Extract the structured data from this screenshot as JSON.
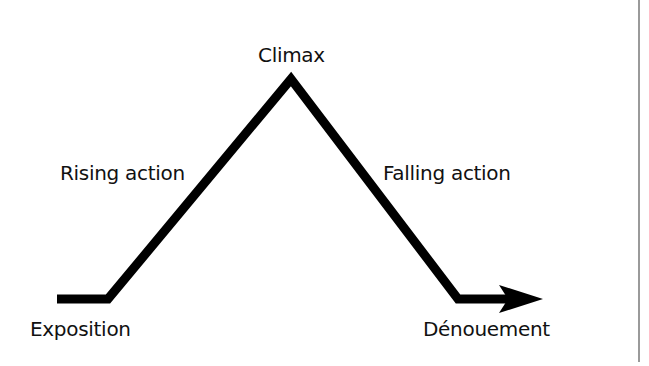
{
  "diagram": {
    "type": "freytag-pyramid",
    "labels": {
      "climax": "Climax",
      "rising_action": "Rising action",
      "falling_action": "Falling action",
      "exposition": "Exposition",
      "denouement": "Dénouement"
    },
    "path_points": [
      [
        57,
        299
      ],
      [
        108,
        299
      ],
      [
        291,
        79
      ],
      [
        458,
        299
      ],
      [
        527,
        299
      ]
    ],
    "arrow_tip": [
      543,
      299
    ],
    "colors": {
      "line": "#000000",
      "text": "#111111",
      "divider": "#9a9a9a",
      "background": "#ffffff"
    }
  }
}
